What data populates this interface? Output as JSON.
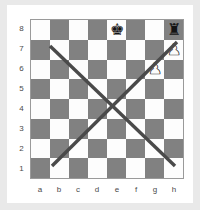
{
  "diagram": {
    "kind": "chess-board-diagram",
    "orientation": "white-bottom",
    "file_labels": [
      "a",
      "b",
      "c",
      "d",
      "e",
      "f",
      "g",
      "h"
    ],
    "rank_labels": [
      "8",
      "7",
      "6",
      "5",
      "4",
      "3",
      "2",
      "1"
    ],
    "colors": {
      "light_square": "#fdfdfd",
      "dark_square": "#818181",
      "board_border": "#9a9a9a",
      "line": "#4a4a4a",
      "page_background": "#e9e9e9",
      "card_background": "#ffffff",
      "label_text": "#4a4a4a"
    },
    "squares": [
      [
        "light",
        "dark",
        "light",
        "dark",
        "light",
        "dark",
        "light",
        "dark"
      ],
      [
        "dark",
        "light",
        "dark",
        "light",
        "dark",
        "light",
        "dark",
        "light"
      ],
      [
        "light",
        "dark",
        "light",
        "dark",
        "light",
        "dark",
        "light",
        "dark"
      ],
      [
        "dark",
        "light",
        "dark",
        "light",
        "dark",
        "light",
        "dark",
        "light"
      ],
      [
        "light",
        "dark",
        "light",
        "dark",
        "light",
        "dark",
        "light",
        "dark"
      ],
      [
        "dark",
        "light",
        "dark",
        "light",
        "dark",
        "light",
        "dark",
        "light"
      ],
      [
        "light",
        "dark",
        "light",
        "dark",
        "light",
        "dark",
        "light",
        "dark"
      ],
      [
        "dark",
        "light",
        "dark",
        "light",
        "dark",
        "light",
        "dark",
        "light"
      ]
    ],
    "pieces": [
      {
        "name": "black-king",
        "square": "e8",
        "file": 4,
        "rank": 8,
        "color": "black",
        "glyph": "♚"
      },
      {
        "name": "black-rook",
        "square": "h8",
        "file": 7,
        "rank": 8,
        "color": "black",
        "glyph": "♜"
      },
      {
        "name": "white-pawn",
        "square": "h7",
        "file": 7,
        "rank": 7,
        "color": "white",
        "glyph": "♟"
      },
      {
        "name": "white-pawn",
        "square": "g6",
        "file": 6,
        "rank": 6,
        "color": "white",
        "glyph": "♟"
      }
    ],
    "lines": [
      {
        "name": "diagonal-a7-g1",
        "from": "b7",
        "to": "g2",
        "x1": 19,
        "y1": 26,
        "x2": 144,
        "y2": 146
      },
      {
        "name": "diagonal-b2-h8",
        "from": "b2",
        "to": "h8",
        "x1": 21,
        "y1": 146,
        "x2": 146,
        "y2": 22
      }
    ],
    "line_width": 3.4
  }
}
